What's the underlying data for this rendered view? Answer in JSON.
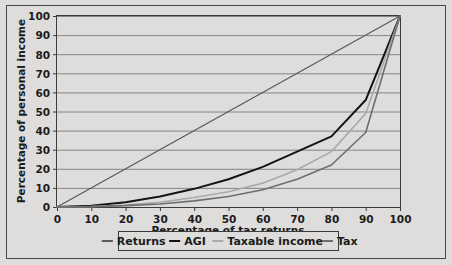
{
  "chart_data": {
    "type": "line",
    "title": "",
    "xlabel": "Percentage of tax returns",
    "ylabel": "Percentage of personal income",
    "xlim": [
      0,
      100
    ],
    "ylim": [
      0,
      100
    ],
    "xticks": [
      0,
      10,
      20,
      30,
      40,
      50,
      60,
      70,
      80,
      90,
      100
    ],
    "yticks": [
      0,
      10,
      20,
      30,
      40,
      50,
      60,
      70,
      80,
      90,
      100
    ],
    "xtick_labels": [
      "0",
      "10",
      "20",
      "30",
      "40",
      "50",
      "60",
      "70",
      "80",
      "90",
      "100"
    ],
    "ytick_labels": [
      "0",
      "10",
      "20",
      "30",
      "40",
      "50",
      "60",
      "70",
      "80",
      "90",
      "100"
    ],
    "grid": "horizontal",
    "legend_position": "bottom",
    "plot_background": "#dedddb",
    "series": [
      {
        "name": "Returns",
        "color": "#5a5a5a",
        "width": 1.3,
        "x": [
          0,
          100
        ],
        "values": [
          0,
          100
        ]
      },
      {
        "name": "AGI",
        "color": "#141414",
        "width": 2.0,
        "x": [
          0,
          10,
          20,
          30,
          40,
          50,
          60,
          70,
          80,
          90,
          100
        ],
        "values": [
          0,
          0.6,
          2.5,
          5.5,
          9.5,
          14.5,
          21,
          29,
          37,
          56,
          100
        ]
      },
      {
        "name": "Taxable income",
        "color": "#a9a9a9",
        "width": 1.6,
        "x": [
          0,
          10,
          20,
          30,
          40,
          50,
          60,
          70,
          80,
          90,
          100
        ],
        "values": [
          0,
          0.3,
          1.0,
          2.5,
          5.0,
          8.0,
          12.5,
          19.5,
          29,
          49,
          100
        ]
      },
      {
        "name": "Tax",
        "color": "#6e6e6e",
        "width": 1.6,
        "x": [
          0,
          10,
          20,
          30,
          40,
          50,
          60,
          70,
          80,
          90,
          100
        ],
        "values": [
          0,
          0.2,
          0.7,
          1.6,
          3.2,
          5.5,
          9.0,
          14.5,
          22,
          39,
          100
        ]
      }
    ]
  },
  "legend": {
    "entries": [
      {
        "label": "Returns",
        "color": "#5a5a5a"
      },
      {
        "label": "AGI",
        "color": "#141414"
      },
      {
        "label": "Taxable income",
        "color": "#a9a9a9"
      },
      {
        "label": "Tax",
        "color": "#6e6e6e"
      }
    ]
  }
}
